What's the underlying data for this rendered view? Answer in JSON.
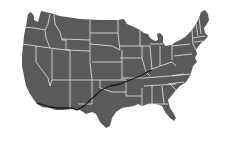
{
  "map": {
    "subject": "Contiguous United States",
    "land_color": "#5a5a5a",
    "border_color": "#d8d8d8",
    "route_color": "#1a1a1a",
    "background_color": "#ffffff",
    "route": {
      "description": "Route from southern California east through Arizona, New Mexico, the Texas panhandle/Oklahoma, Missouri toward Illinois",
      "points": [
        [
          37,
          103
        ],
        [
          44,
          105
        ],
        [
          50,
          107
        ],
        [
          58,
          108
        ],
        [
          66,
          108
        ],
        [
          72,
          108
        ],
        [
          77,
          110
        ],
        [
          84,
          106
        ],
        [
          90,
          100
        ],
        [
          95,
          96
        ],
        [
          101,
          90
        ],
        [
          110,
          86
        ],
        [
          120,
          84
        ],
        [
          130,
          80
        ],
        [
          140,
          76
        ],
        [
          147,
          72
        ],
        [
          152,
          70
        ]
      ]
    }
  }
}
